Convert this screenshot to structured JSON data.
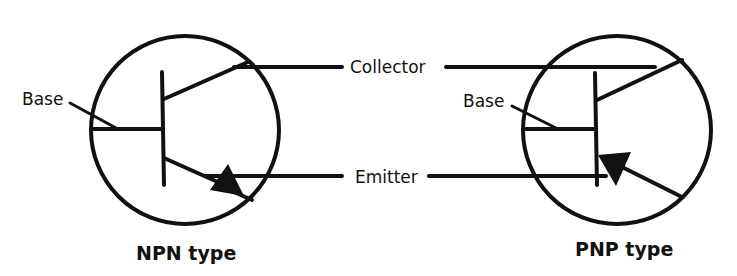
{
  "diagram": {
    "shared_labels": {
      "collector": "Collector",
      "emitter": "Emitter"
    },
    "npn": {
      "title": "NPN type",
      "base_label": "Base"
    },
    "pnp": {
      "title": "PNP type",
      "base_label": "Base"
    },
    "colors": {
      "ink": "#111111",
      "background": "#ffffff"
    }
  }
}
